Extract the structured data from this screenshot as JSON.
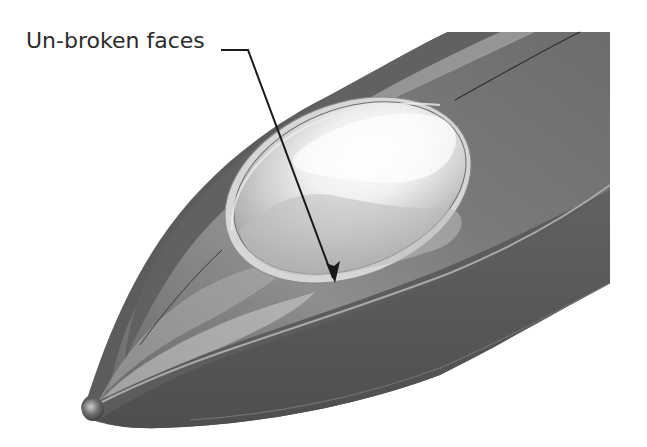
{
  "figure": {
    "callout": {
      "label": "Un-broken faces",
      "leader": {
        "start": [
          221,
          50
        ],
        "elbow": [
          248,
          50
        ],
        "end": [
          335,
          282
        ]
      }
    },
    "colors": {
      "background": "#ffffff",
      "body_dark": "#5a5a5a",
      "body_mid": "#777777",
      "body_light": "#a8a8a8",
      "canopy_light": "#f2f2f2",
      "canopy_mid": "#c9c9c9",
      "edge_line": "#3a3a3a",
      "highlight_line": "#bdbdbd",
      "leader_line": "#1a1a1a",
      "label_text": "#2b2b2b"
    }
  }
}
